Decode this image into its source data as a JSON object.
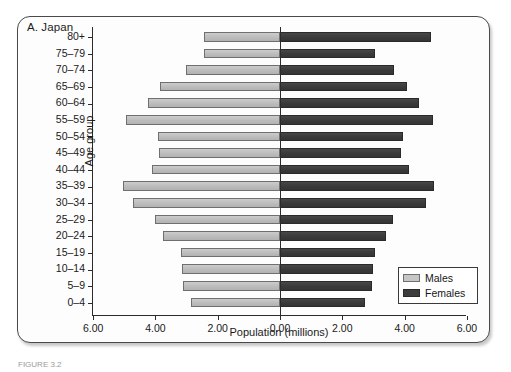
{
  "figure": {
    "panel_title": "A. Japan",
    "caption": "FIGURE 3.2"
  },
  "legend": {
    "position": "bottom-right",
    "items": [
      {
        "label": "Males",
        "swatch": "light-gray",
        "color": "#c6c6c6"
      },
      {
        "label": "Females",
        "swatch": "dark-gray",
        "color": "#3d3d3d"
      }
    ]
  },
  "axes": {
    "x_title": "Population (millions)",
    "y_title": "Age group",
    "x_tick_labels": [
      "6.00",
      "4.00",
      "2.00",
      "0.00",
      "2.00",
      "4.00",
      "6.00"
    ],
    "x_tick_values": [
      -6,
      -4,
      -2,
      0,
      2,
      4,
      6
    ]
  },
  "chart_data": {
    "type": "bar",
    "title": "A. Japan",
    "xlabel": "Population (millions)",
    "ylabel": "Age group",
    "orientation": "horizontal",
    "layout": "population-pyramid",
    "grid": false,
    "legend_position": "bottom-right",
    "xlim": [
      -6,
      6
    ],
    "xticks": [
      -6,
      -4,
      -2,
      0,
      2,
      4,
      6
    ],
    "xticklabels": [
      "6.00",
      "4.00",
      "2.00",
      "0.00",
      "2.00",
      "4.00",
      "6.00"
    ],
    "categories": [
      "80+",
      "75-79",
      "70-74",
      "65-69",
      "60-64",
      "55-59",
      "50-54",
      "45-49",
      "40-44",
      "35-39",
      "30-34",
      "25-29",
      "20-24",
      "15-19",
      "10-14",
      "5-9",
      "0-4"
    ],
    "series": [
      {
        "name": "Males",
        "color": "#c6c6c6",
        "direction": "left",
        "values": [
          2.45,
          2.44,
          3.02,
          3.85,
          4.24,
          4.94,
          3.92,
          3.88,
          4.11,
          5.04,
          4.72,
          4.01,
          3.76,
          3.18,
          3.15,
          3.11,
          2.86
        ]
      },
      {
        "name": "Females",
        "color": "#3d3d3d",
        "direction": "right",
        "values": [
          4.85,
          3.05,
          3.66,
          4.08,
          4.46,
          4.91,
          3.95,
          3.88,
          4.14,
          4.94,
          4.69,
          3.63,
          3.4,
          3.05,
          2.99,
          2.95,
          2.73
        ]
      }
    ]
  }
}
